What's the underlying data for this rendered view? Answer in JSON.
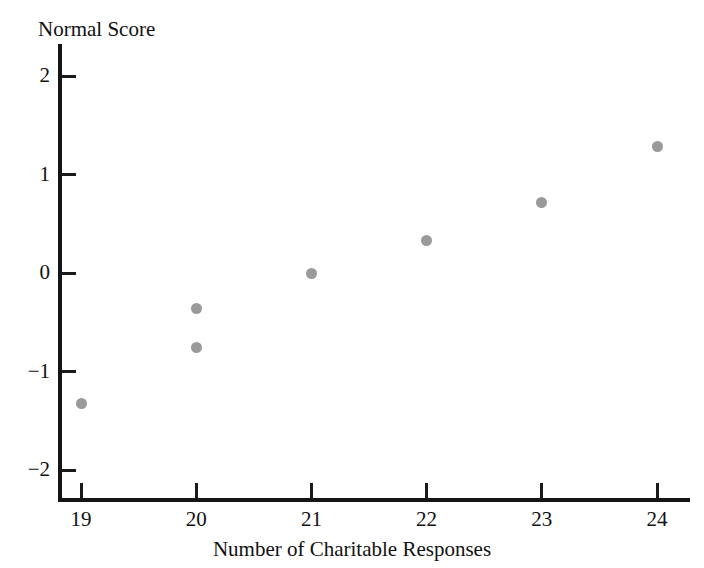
{
  "chart_data": {
    "type": "scatter",
    "title": "",
    "xlabel": "Number of Charitable Responses",
    "ylabel": "Normal Score",
    "xlim": [
      18.4,
      24.6
    ],
    "ylim": [
      -2.35,
      2.35
    ],
    "grid": false,
    "legend": null,
    "x": [
      19,
      20,
      20,
      21,
      22,
      23,
      24
    ],
    "y": [
      -1.32,
      -0.76,
      -0.36,
      0.0,
      0.33,
      0.72,
      1.28
    ],
    "points": [
      {
        "x": 19,
        "y": -1.32
      },
      {
        "x": 20,
        "y": -0.76
      },
      {
        "x": 20,
        "y": -0.36
      },
      {
        "x": 21,
        "y": 0.0
      },
      {
        "x": 22,
        "y": 0.33
      },
      {
        "x": 23,
        "y": 0.72
      },
      {
        "x": 24,
        "y": 1.28
      }
    ],
    "marker_color": "#9a9a9a",
    "axis_color": "#151515",
    "background_color": "#ffffff",
    "xticks": [
      19,
      20,
      21,
      22,
      23,
      24
    ],
    "xtick_labels": [
      "19",
      "20",
      "21",
      "22",
      "23",
      "24"
    ],
    "yticks": [
      2,
      1,
      0,
      -1,
      -2
    ],
    "ytick_labels": [
      "2",
      "1",
      "0",
      "−1",
      "−2"
    ]
  }
}
